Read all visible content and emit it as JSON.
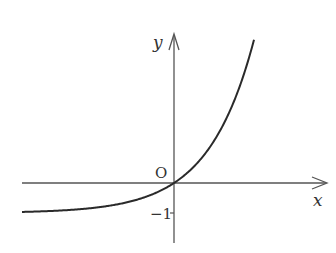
{
  "figure": {
    "axes": {
      "x_label": "x",
      "y_label": "y",
      "origin_label": "O",
      "tick_labels": {
        "y_minus_one": "−1"
      }
    },
    "curve": {
      "asymptote": -1,
      "passes_through": [
        0,
        0
      ],
      "shape": "increasing exponential (y = a^x − 1)"
    },
    "colors": {
      "axis": "#555555",
      "curve": "#2a2a2a",
      "text": "#333333"
    }
  }
}
